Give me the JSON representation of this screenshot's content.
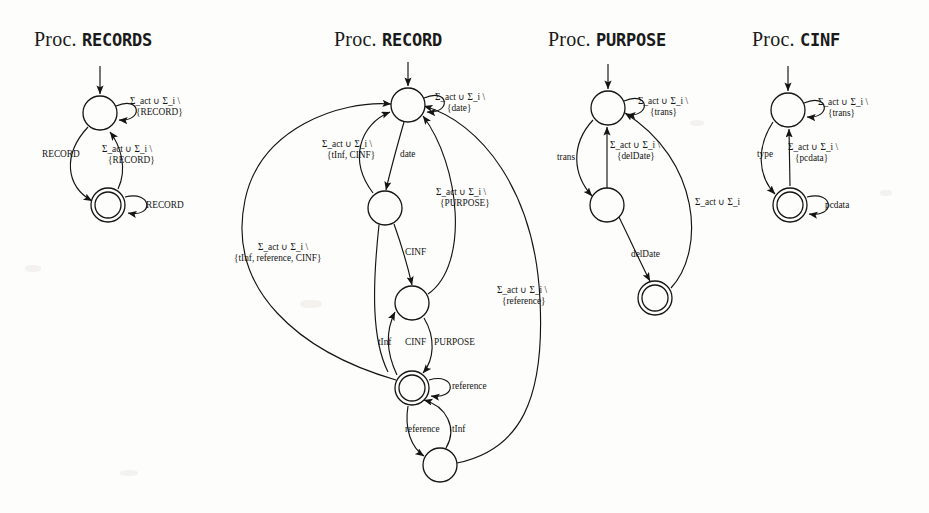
{
  "page": {
    "background": "#fdfdfb",
    "ink": "#141414",
    "width": 929,
    "height": 513,
    "figure_kind": "finite-state-automata-diagram"
  },
  "automata": [
    {
      "id": "records",
      "title_prefix": "Proc.",
      "title_name": "RECORDS",
      "title_x": 34,
      "title_y": 48,
      "states": [
        {
          "id": "r0",
          "cx": 100,
          "cy": 113,
          "r": 17,
          "accepting": false,
          "start": true
        },
        {
          "id": "r1",
          "cx": 108,
          "cy": 205,
          "r": 17,
          "accepting": true,
          "start": false
        }
      ],
      "labels": [
        {
          "text": "Σ_act ∪ Σ_i \\",
          "x": 130,
          "y": 104,
          "anchor": "start"
        },
        {
          "text": "{RECORD}",
          "x": 136,
          "y": 115,
          "anchor": "start"
        },
        {
          "text": "RECORD",
          "x": 42,
          "y": 157,
          "anchor": "start"
        },
        {
          "text": "Σ_act ∪ Σ_i \\",
          "x": 102,
          "y": 152,
          "anchor": "start"
        },
        {
          "text": "{RECORD}",
          "x": 108,
          "y": 163,
          "anchor": "start"
        },
        {
          "text": "RECORD",
          "x": 146,
          "y": 208,
          "anchor": "start"
        }
      ]
    },
    {
      "id": "record",
      "title_prefix": "Proc.",
      "title_name": "RECORD",
      "title_x": 334,
      "title_y": 48,
      "states": [
        {
          "id": "d0",
          "cx": 408,
          "cy": 105,
          "r": 17,
          "accepting": false,
          "start": true
        },
        {
          "id": "d1",
          "cx": 385,
          "cy": 208,
          "r": 17,
          "accepting": false,
          "start": false
        },
        {
          "id": "d2",
          "cx": 412,
          "cy": 303,
          "r": 17,
          "accepting": false,
          "start": false
        },
        {
          "id": "d3",
          "cx": 412,
          "cy": 388,
          "r": 17,
          "accepting": true,
          "start": false
        },
        {
          "id": "d4",
          "cx": 440,
          "cy": 465,
          "r": 17,
          "accepting": false,
          "start": false
        }
      ],
      "labels": [
        {
          "text": "Σ_act ∪ Σ_i \\",
          "x": 435,
          "y": 100,
          "anchor": "start"
        },
        {
          "text": "{date}",
          "x": 447,
          "y": 111,
          "anchor": "start"
        },
        {
          "text": "Σ_act ∪ Σ_i \\",
          "x": 322,
          "y": 147,
          "anchor": "start"
        },
        {
          "text": "{tInf, CINF}",
          "x": 327,
          "y": 158,
          "anchor": "start"
        },
        {
          "text": "date",
          "x": 400,
          "y": 157,
          "anchor": "start"
        },
        {
          "text": "Σ_act ∪ Σ_i \\",
          "x": 436,
          "y": 195,
          "anchor": "start"
        },
        {
          "text": "{PURPOSE}",
          "x": 440,
          "y": 206,
          "anchor": "start"
        },
        {
          "text": "CINF",
          "x": 405,
          "y": 255,
          "anchor": "start"
        },
        {
          "text": "Σ_act ∪ Σ_i \\",
          "x": 258,
          "y": 250,
          "anchor": "start"
        },
        {
          "text": "{tInf, reference, CINF}",
          "x": 234,
          "y": 261,
          "anchor": "start"
        },
        {
          "text": "Σ_act ∪ Σ_i \\",
          "x": 497,
          "y": 293,
          "anchor": "start"
        },
        {
          "text": "{reference}",
          "x": 502,
          "y": 304,
          "anchor": "start"
        },
        {
          "text": "tInf",
          "x": 378,
          "y": 345,
          "anchor": "start"
        },
        {
          "text": "CINF",
          "x": 405,
          "y": 345,
          "anchor": "start"
        },
        {
          "text": "PURPOSE",
          "x": 434,
          "y": 345,
          "anchor": "start"
        },
        {
          "text": "reference",
          "x": 452,
          "y": 389,
          "anchor": "start"
        },
        {
          "text": "reference",
          "x": 405,
          "y": 432,
          "anchor": "start"
        },
        {
          "text": "tInf",
          "x": 452,
          "y": 432,
          "anchor": "start"
        }
      ]
    },
    {
      "id": "purpose",
      "title_prefix": "Proc.",
      "title_name": "PURPOSE",
      "title_x": 548,
      "title_y": 48,
      "states": [
        {
          "id": "p0",
          "cx": 608,
          "cy": 108,
          "r": 17,
          "accepting": false,
          "start": true
        },
        {
          "id": "p1",
          "cx": 607,
          "cy": 205,
          "r": 17,
          "accepting": false,
          "start": false
        },
        {
          "id": "p2",
          "cx": 655,
          "cy": 298,
          "r": 17,
          "accepting": true,
          "start": false
        }
      ],
      "labels": [
        {
          "text": "Σ_act ∪ Σ_i \\",
          "x": 638,
          "y": 104,
          "anchor": "start"
        },
        {
          "text": "{trans}",
          "x": 650,
          "y": 115,
          "anchor": "start"
        },
        {
          "text": "trans",
          "x": 557,
          "y": 160,
          "anchor": "start"
        },
        {
          "text": "Σ_act ∪ Σ_i \\",
          "x": 610,
          "y": 148,
          "anchor": "start"
        },
        {
          "text": "{delDate}",
          "x": 617,
          "y": 159,
          "anchor": "start"
        },
        {
          "text": "Σ_act ∪ Σ_i",
          "x": 695,
          "y": 205,
          "anchor": "start"
        },
        {
          "text": "delDate",
          "x": 631,
          "y": 257,
          "anchor": "start"
        }
      ]
    },
    {
      "id": "cinf",
      "title_prefix": "Proc.",
      "title_name": "CINF",
      "title_x": 752,
      "title_y": 48,
      "states": [
        {
          "id": "c0",
          "cx": 788,
          "cy": 110,
          "r": 17,
          "accepting": false,
          "start": true
        },
        {
          "id": "c1",
          "cx": 790,
          "cy": 205,
          "r": 17,
          "accepting": true,
          "start": false
        }
      ],
      "labels": [
        {
          "text": "Σ_act ∪ Σ_i \\",
          "x": 818,
          "y": 105,
          "anchor": "start"
        },
        {
          "text": "{trans}",
          "x": 828,
          "y": 116,
          "anchor": "start"
        },
        {
          "text": "type",
          "x": 757,
          "y": 157,
          "anchor": "start"
        },
        {
          "text": "Σ_act ∪ Σ_i \\",
          "x": 788,
          "y": 150,
          "anchor": "start"
        },
        {
          "text": "{pcdata}",
          "x": 795,
          "y": 161,
          "anchor": "start"
        },
        {
          "text": "pcdata",
          "x": 825,
          "y": 208,
          "anchor": "start"
        }
      ]
    }
  ]
}
